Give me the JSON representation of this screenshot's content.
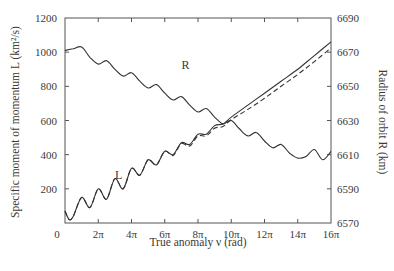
{
  "chart_data": {
    "type": "line",
    "title": "",
    "xlabel": "True anomaly ν (rad)",
    "ylabel": "Specific moment of momentum L (km²/s)",
    "ylabel_right": "Radius of orbit R (km)",
    "xlim": [
      0,
      16
    ],
    "x_unit": "π rad",
    "ylim": [
      0,
      1200
    ],
    "ylim_right": [
      6570,
      6690
    ],
    "x_ticks": [
      "0",
      "2π",
      "4π",
      "6π",
      "8π",
      "10π",
      "12π",
      "14π",
      "16π"
    ],
    "x_tick_values": [
      0,
      2,
      4,
      6,
      8,
      10,
      12,
      14,
      16
    ],
    "y_ticks": [
      "200",
      "400",
      "600",
      "800",
      "1000",
      "1200"
    ],
    "y_tick_values": [
      200,
      400,
      600,
      800,
      1000,
      1200
    ],
    "y_right_ticks": [
      "6570",
      "6590",
      "6610",
      "6630",
      "6650",
      "6670",
      "6690"
    ],
    "y_right_tick_values": [
      6570,
      6590,
      6610,
      6630,
      6650,
      6670,
      6690
    ],
    "grid": false,
    "legend": "inline labels",
    "annotations": [
      {
        "text": "L",
        "x": 3.0,
        "y": 260,
        "axis": "left"
      },
      {
        "text": "R",
        "x": 7.0,
        "y": 6660,
        "axis": "right"
      }
    ],
    "series": [
      {
        "name": "L (solid)",
        "axis": "left",
        "style": "solid",
        "x": [
          0,
          0.25,
          0.5,
          1.0,
          1.5,
          2.0,
          2.5,
          3.0,
          3.5,
          4.0,
          4.5,
          5.0,
          5.5,
          6.0,
          6.5,
          7.0,
          7.5,
          8.0,
          8.5,
          9.0,
          9.5,
          10.0,
          11.0,
          12.0,
          13.0,
          14.0,
          15.0,
          16.0
        ],
        "values": [
          70,
          20,
          40,
          150,
          90,
          200,
          140,
          260,
          200,
          320,
          280,
          370,
          340,
          420,
          400,
          470,
          460,
          520,
          520,
          570,
          580,
          620,
          690,
          760,
          830,
          900,
          980,
          1060
        ]
      },
      {
        "name": "L (dashed)",
        "axis": "left",
        "style": "dashed",
        "x": [
          0,
          0.25,
          0.5,
          1.0,
          1.5,
          2.0,
          2.5,
          3.0,
          3.5,
          4.0,
          4.5,
          5.0,
          5.5,
          6.0,
          6.5,
          7.0,
          7.5,
          8.0,
          8.5,
          9.0,
          9.5,
          10.0,
          11.0,
          12.0,
          13.0,
          14.0,
          15.0,
          16.0
        ],
        "values": [
          70,
          20,
          40,
          150,
          90,
          200,
          140,
          260,
          200,
          320,
          280,
          370,
          340,
          420,
          395,
          465,
          450,
          510,
          510,
          555,
          565,
          605,
          665,
          730,
          800,
          870,
          945,
          1025
        ]
      },
      {
        "name": "R",
        "axis": "right",
        "style": "solid",
        "x": [
          0,
          0.5,
          1.0,
          1.5,
          2.0,
          2.5,
          3.0,
          3.5,
          4.0,
          4.5,
          5.0,
          5.5,
          6.0,
          6.5,
          7.0,
          7.5,
          8.0,
          8.5,
          9.0,
          9.5,
          10.0,
          10.5,
          11.0,
          11.5,
          12.0,
          12.5,
          13.0,
          13.5,
          14.0,
          14.5,
          15.0,
          15.5,
          16.0
        ],
        "values": [
          6671,
          6672,
          6673,
          6667,
          6663,
          6665,
          6660,
          6656,
          6658,
          6653,
          6649,
          6651,
          6646,
          6642,
          6644,
          6639,
          6635,
          6637,
          6632,
          6628,
          6630,
          6625,
          6621,
          6623,
          6618,
          6614,
          6616,
          6611,
          6608,
          6609,
          6613,
          6607,
          6612
        ]
      }
    ]
  },
  "colors": {
    "line": "#333333",
    "axis": "#555555",
    "text": "#3a3a3a",
    "background": "#ffffff"
  }
}
